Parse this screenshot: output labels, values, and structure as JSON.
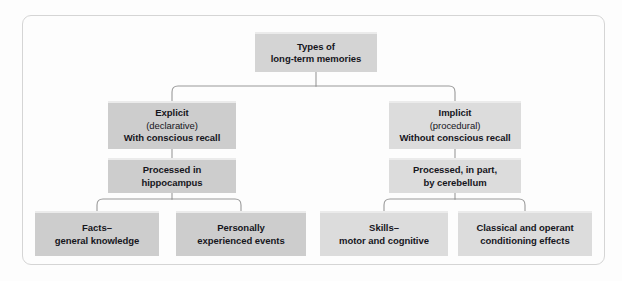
{
  "diagram": {
    "type": "hierarchy-tree",
    "frame": {
      "visible": true,
      "border_color": "#d5d5d5",
      "corner_radius_px": 9
    },
    "palette": {
      "box_dark": "#cdcdcd",
      "box_mid": "#d4d4d4",
      "box_light": "#dcdcdc",
      "box_top_highlight": "#ebebeb",
      "connector": "#9a9a9a",
      "text": "#16161c",
      "background": "#fdfdfd"
    },
    "nodes": {
      "root": {
        "id": "types-of-long-term-memories",
        "level": 1,
        "lines": [
          "Types of",
          "long-term memories"
        ]
      },
      "explicit": {
        "id": "explicit",
        "level": 2,
        "branch": "left",
        "lines": [
          "Explicit",
          "(declarative)",
          "With conscious recall"
        ],
        "regular_weight_lines": [
          "(declarative)"
        ]
      },
      "implicit": {
        "id": "implicit",
        "level": 2,
        "branch": "right",
        "lines": [
          "Implicit",
          "(procedural)",
          "Without conscious recall"
        ],
        "regular_weight_lines": [
          "(procedural)"
        ]
      },
      "hippocampus": {
        "id": "processed-in-hippocampus",
        "level": 3,
        "branch": "left",
        "lines": [
          "Processed in",
          "hippocampus"
        ]
      },
      "cerebellum": {
        "id": "processed-by-cerebellum",
        "level": 3,
        "branch": "right",
        "lines": [
          "Processed, in part,",
          "by cerebellum"
        ]
      },
      "facts": {
        "id": "facts-general-knowledge",
        "level": 4,
        "branch": "left",
        "lines": [
          "Facts–",
          "general knowledge"
        ]
      },
      "personal": {
        "id": "personally-experienced-events",
        "level": 4,
        "branch": "left",
        "lines": [
          "Personally",
          "experienced events"
        ]
      },
      "skills": {
        "id": "skills-motor-and-cognitive",
        "level": 4,
        "branch": "right",
        "lines": [
          "Skills–",
          "motor and cognitive"
        ]
      },
      "conditioning": {
        "id": "classical-and-operant-conditioning-effects",
        "level": 4,
        "branch": "right",
        "lines": [
          "Classical and operant",
          "conditioning effects"
        ]
      }
    },
    "edges": [
      {
        "from": "root",
        "to": "explicit"
      },
      {
        "from": "root",
        "to": "implicit"
      },
      {
        "from": "explicit",
        "to": "hippocampus"
      },
      {
        "from": "implicit",
        "to": "cerebellum"
      },
      {
        "from": "hippocampus",
        "to": "facts"
      },
      {
        "from": "hippocampus",
        "to": "personal"
      },
      {
        "from": "cerebellum",
        "to": "skills"
      },
      {
        "from": "cerebellum",
        "to": "conditioning"
      }
    ]
  }
}
